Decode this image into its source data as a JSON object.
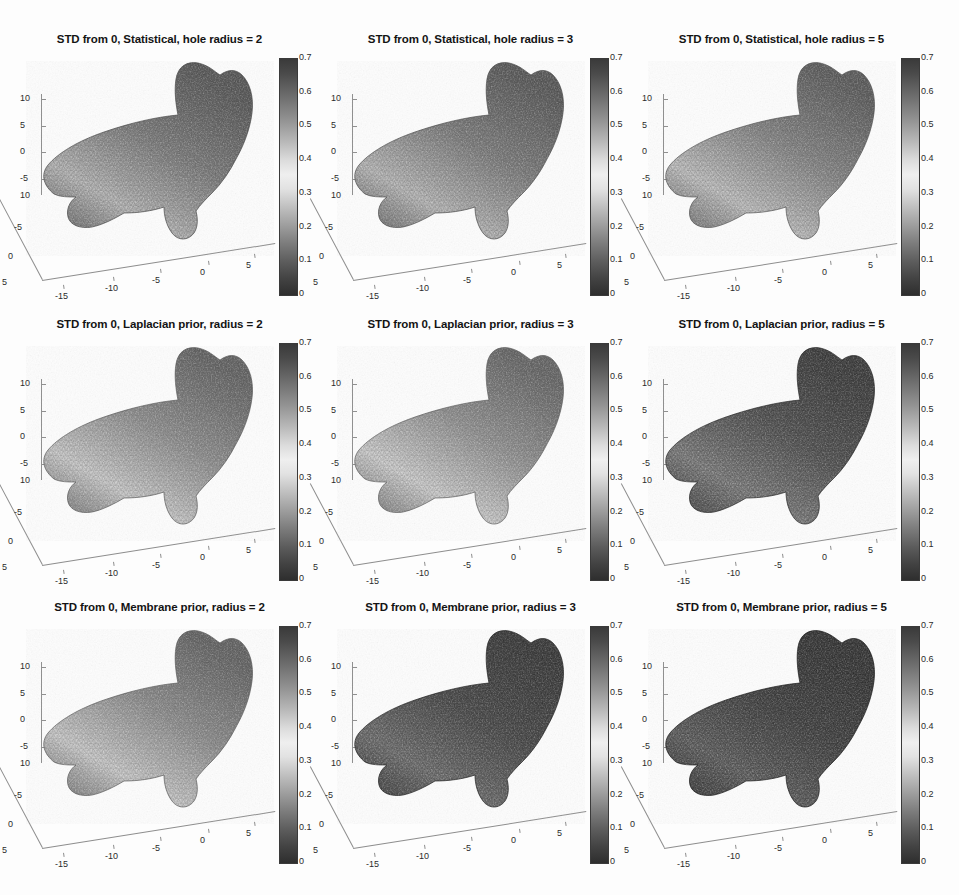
{
  "figure": {
    "width": 959,
    "height": 895,
    "background": "#ffffff",
    "grid": {
      "rows": 3,
      "cols": 3
    }
  },
  "chart_data": {
    "type": "heatmap",
    "colormap": "gray-bone (dark at 0, light near 0.35-0.4, dark again at 0.7)",
    "colorbar": {
      "min": 0,
      "max": 0.7,
      "ticks": [
        0,
        0.1,
        0.2,
        0.3,
        0.4,
        0.5,
        0.6,
        0.7
      ],
      "tick_labels": [
        "0",
        "0.1",
        "0.2",
        "0.3",
        "0.4",
        "0.5",
        "0.6",
        "0.7"
      ],
      "orientation": "vertical",
      "position": "right of each subplot"
    },
    "axes": {
      "x_ticks": [
        -15,
        -10,
        -5,
        0,
        5
      ],
      "x_tick_labels": [
        "-15",
        "-10",
        "-5",
        "0",
        "5"
      ],
      "y_ticks": [
        10,
        -5,
        0,
        5
      ],
      "y_tick_labels": [
        "10",
        "-5",
        "0",
        "5"
      ],
      "z_ticks": [
        10,
        5,
        0,
        -5
      ],
      "z_tick_labels": [
        "10",
        "5",
        "0",
        "-5"
      ],
      "xlabel": "",
      "ylabel": "",
      "zlabel": "",
      "grid": false,
      "view": "3-D perspective"
    },
    "panels": [
      {
        "row": 0,
        "col": 0,
        "title": "STD from 0, Statistical, hole radius = 2",
        "method": "Statistical",
        "radius": 2,
        "mean_shade": "mid-gray (~0.35)"
      },
      {
        "row": 0,
        "col": 1,
        "title": "STD from 0, Statistical, hole radius = 3",
        "method": "Statistical",
        "radius": 3,
        "mean_shade": "mid-gray (~0.35)"
      },
      {
        "row": 0,
        "col": 2,
        "title": "STD from 0, Statistical, hole radius = 5",
        "method": "Statistical",
        "radius": 5,
        "mean_shade": "light-mid gray (~0.38)"
      },
      {
        "row": 1,
        "col": 0,
        "title": "STD from 0, Laplacian prior, radius = 2",
        "method": "Laplacian prior",
        "radius": 2,
        "mean_shade": "light gray (~0.40)"
      },
      {
        "row": 1,
        "col": 1,
        "title": "STD from 0, Laplacian prior, radius = 3",
        "method": "Laplacian prior",
        "radius": 3,
        "mean_shade": "light gray (~0.40)"
      },
      {
        "row": 1,
        "col": 2,
        "title": "STD from 0, Laplacian prior, radius = 5",
        "method": "Laplacian prior",
        "radius": 5,
        "mean_shade": "dark gray (~0.18)"
      },
      {
        "row": 2,
        "col": 0,
        "title": "STD from 0, Membrane prior, radius = 2",
        "method": "Membrane prior",
        "radius": 2,
        "mean_shade": "light gray (~0.40)"
      },
      {
        "row": 2,
        "col": 1,
        "title": "STD from 0, Membrane prior, radius = 3",
        "method": "Membrane prior",
        "radius": 3,
        "mean_shade": "dark gray (~0.15)"
      },
      {
        "row": 2,
        "col": 2,
        "title": "STD from 0, Membrane prior, radius = 5",
        "method": "Membrane prior",
        "radius": 5,
        "mean_shade": "very dark gray (~0.08)"
      }
    ]
  }
}
